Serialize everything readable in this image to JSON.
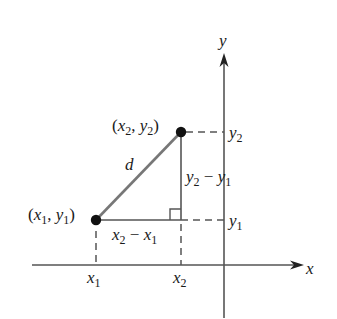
{
  "diagram": {
    "axes": {
      "x_label": "x",
      "y_label": "y"
    },
    "points": [
      {
        "name": "P1",
        "label_var_x": "x",
        "label_sub_x": "1",
        "label_var_y": "y",
        "label_sub_y": "1"
      },
      {
        "name": "P2",
        "label_var_x": "x",
        "label_sub_x": "2",
        "label_var_y": "y",
        "label_sub_y": "2"
      }
    ],
    "hypotenuse_label": "d",
    "horizontal_leg_label": {
      "a": "x",
      "a_sub": "2",
      "op": "−",
      "b": "x",
      "b_sub": "1"
    },
    "vertical_leg_label": {
      "a": "y",
      "a_sub": "2",
      "op": "−",
      "b": "y",
      "b_sub": "1"
    },
    "x_ticks": [
      {
        "var": "x",
        "sub": "1"
      },
      {
        "var": "x",
        "sub": "2"
      }
    ],
    "y_ticks": [
      {
        "var": "y",
        "sub": "2"
      },
      {
        "var": "y",
        "sub": "1"
      }
    ],
    "colors": {
      "axis": "#555555",
      "segment": "#777777",
      "point": "#111111",
      "text": "#1a1a1a"
    }
  }
}
